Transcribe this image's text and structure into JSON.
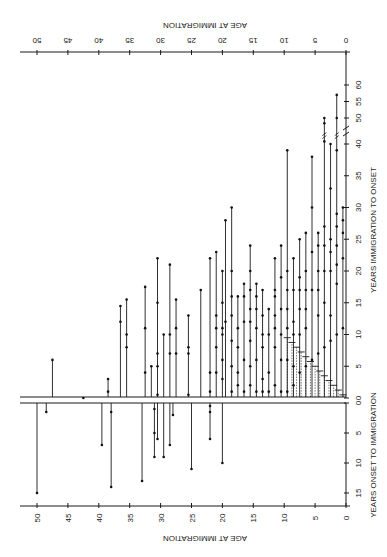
{
  "chart_data": {
    "type": "scatter",
    "subtype": "vertical-segment plot (per-patient lines)",
    "orientation": "figure printed rotated; labels on top axis read upside-down",
    "panels": [
      {
        "name": "upper",
        "ylabel": "YEARS IMMIGRATION TO ONSET",
        "yticks": [
          0,
          5,
          10,
          15,
          20,
          25,
          30,
          35,
          40,
          50,
          55,
          60
        ],
        "axis_break": "between 40 and 50 (marked //)",
        "ylim": [
          0,
          62
        ]
      },
      {
        "name": "lower",
        "ylabel": "YEARS ONSET TO IMMIGRATION",
        "yticks": [
          0,
          5,
          10,
          15
        ],
        "ylim": [
          0,
          17
        ],
        "direction": "downward"
      }
    ],
    "xlabel_top": "AGE AT IMMIGRATION",
    "xlabel_bottom": "AGE AT IMMIGRATION",
    "xticks": [
      50,
      45,
      40,
      35,
      30,
      25,
      20,
      15,
      10,
      5,
      0
    ],
    "xlim": [
      52,
      0
    ],
    "lower_segments": [
      {
        "age": 50,
        "ends": [
          15
        ]
      },
      {
        "age": 48.5,
        "ends": [
          1.5
        ]
      },
      {
        "age": 39.5,
        "ends": [
          7
        ]
      },
      {
        "age": 38,
        "ends": [
          1.5,
          14
        ]
      },
      {
        "age": 33,
        "ends": [
          13
        ]
      },
      {
        "age": 31,
        "ends": [
          1,
          5,
          9
        ]
      },
      {
        "age": 30.5,
        "ends": [
          6
        ]
      },
      {
        "age": 29.5,
        "ends": [
          9
        ]
      },
      {
        "age": 28.5,
        "ends": [
          7
        ]
      },
      {
        "age": 28,
        "ends": [
          2
        ]
      },
      {
        "age": 25,
        "ends": [
          11
        ]
      },
      {
        "age": 22,
        "ends": [
          0.5,
          1.5,
          6
        ]
      },
      {
        "age": 20,
        "ends": [
          10
        ]
      }
    ],
    "upper_segments": [
      {
        "age": 47.5,
        "ends": [
          6
        ]
      },
      {
        "age": 42.5,
        "ends": [
          0
        ]
      },
      {
        "age": 38.5,
        "ends": [
          1,
          3
        ]
      },
      {
        "age": 36.5,
        "ends": [
          12,
          14.5
        ]
      },
      {
        "age": 35.5,
        "ends": [
          8,
          10,
          15.5
        ]
      },
      {
        "age": 32.5,
        "ends": [
          4,
          11,
          17.5
        ]
      },
      {
        "age": 31.5,
        "ends": [
          5
        ]
      },
      {
        "age": 30.5,
        "ends": [
          0.5,
          5,
          7,
          15,
          22
        ]
      },
      {
        "age": 29.5,
        "ends": [
          10
        ]
      },
      {
        "age": 28.5,
        "ends": [
          7,
          10,
          21
        ]
      },
      {
        "age": 27.5,
        "ends": [
          7,
          11,
          15.5
        ]
      },
      {
        "age": 25.5,
        "ends": [
          0.5,
          7,
          8,
          13
        ]
      },
      {
        "age": 23.5,
        "ends": [
          17
        ]
      },
      {
        "age": 22,
        "ends": [
          1,
          4,
          22
        ]
      },
      {
        "age": 21,
        "ends": [
          4,
          8,
          11,
          13,
          23
        ]
      },
      {
        "age": 20,
        "ends": [
          3,
          6,
          10,
          11,
          15,
          20
        ]
      },
      {
        "age": 19.5,
        "ends": [
          12,
          28
        ]
      },
      {
        "age": 18.5,
        "ends": [
          1,
          5,
          9,
          13,
          16,
          20,
          30
        ]
      },
      {
        "age": 17.5,
        "ends": [
          2,
          4,
          8,
          11,
          16
        ]
      },
      {
        "age": 16.5,
        "ends": [
          1,
          6,
          12,
          16,
          18
        ]
      },
      {
        "age": 15.5,
        "ends": [
          2,
          5,
          9,
          12,
          14,
          17,
          20,
          24
        ]
      },
      {
        "age": 14.5,
        "ends": [
          1,
          6,
          11,
          14,
          16,
          18
        ]
      },
      {
        "age": 13.5,
        "ends": [
          1,
          3,
          8,
          10,
          13,
          17
        ]
      },
      {
        "age": 12.5,
        "ends": [
          1,
          4,
          10,
          14
        ]
      },
      {
        "age": 11.5,
        "ends": [
          2,
          8,
          11,
          13,
          16,
          17,
          22
        ]
      },
      {
        "age": 10.5,
        "ends": [
          1,
          6,
          10,
          14,
          19,
          24
        ]
      },
      {
        "age": 9.5,
        "ends": [
          1,
          6,
          11,
          14,
          17,
          20,
          39
        ]
      },
      {
        "age": 8.5,
        "ends": [
          2,
          5,
          10,
          12,
          17,
          22
        ]
      },
      {
        "age": 7.5,
        "ends": [
          4,
          10,
          14,
          17,
          19,
          25
        ]
      },
      {
        "age": 6.5,
        "ends": [
          5,
          11,
          14,
          17,
          20,
          26
        ]
      },
      {
        "age": 5.5,
        "ends": [
          6,
          17,
          23,
          30,
          38
        ]
      },
      {
        "age": 4.5,
        "ends": [
          7,
          13,
          17,
          20,
          24,
          26
        ]
      },
      {
        "age": 3.5,
        "ends": [
          8,
          15,
          20,
          24,
          27,
          41,
          48,
          50
        ]
      },
      {
        "age": 2.5,
        "ends": [
          9,
          13,
          20,
          23,
          25,
          33,
          40
        ]
      },
      {
        "age": 1.5,
        "ends": [
          10,
          18,
          21,
          24,
          27,
          29,
          39,
          50,
          57
        ]
      },
      {
        "age": 0.5,
        "ends": [
          11,
          22,
          26,
          28,
          30
        ]
      }
    ],
    "dashed_segments_note": "dashed vertical lines from 0 to a short horizontal tick for ages ~0-10 (age equals years-to-onset diagonal)",
    "grid": false,
    "legend": null
  }
}
